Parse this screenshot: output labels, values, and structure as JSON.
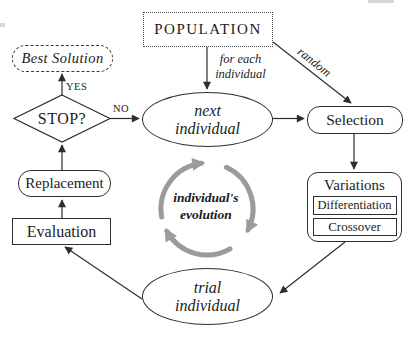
{
  "diagram": {
    "population": "POPULATION",
    "best_solution": "Best Solution",
    "stop": "STOP?",
    "next_individual": {
      "line1": "next",
      "line2": "individual"
    },
    "selection": "Selection",
    "variations": "Variations",
    "differentiation": "Differentiation",
    "crossover": "Crossover",
    "replacement": "Replacement",
    "evaluation": "Evaluation",
    "trial_individual": {
      "line1": "trial",
      "line2": "individual"
    },
    "labels": {
      "yes": "YES",
      "no": "NO",
      "for_each_line1": "for each",
      "for_each_line2": "individual",
      "random": "random",
      "evolution_line1": "individual's",
      "evolution_line2": "evolution"
    },
    "colors": {
      "line": "#2d2d2d",
      "cycle_arrow": "#9b9b9b"
    }
  }
}
